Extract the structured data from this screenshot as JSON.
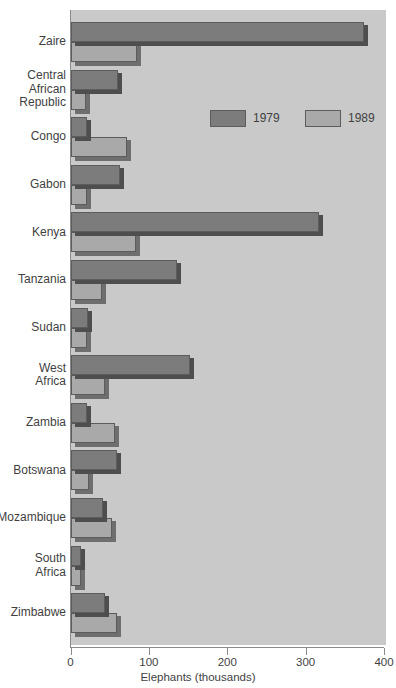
{
  "chart_data": {
    "type": "bar",
    "orientation": "horizontal",
    "title": "",
    "xlabel": "Elephants (thousands)",
    "ylabel": "",
    "xlim": [
      0,
      400
    ],
    "xticks": [
      0,
      100,
      200,
      300,
      400
    ],
    "xtick_labels": [
      "0",
      "100",
      "200",
      "300",
      "400"
    ],
    "grid": false,
    "legend_position": "upper-center",
    "categories": [
      "Zaire",
      "Central\nAfrican\nRepublic",
      "Congo",
      "Gabon",
      "Kenya",
      "Tanzania",
      "Sudan",
      "West\nAfrica",
      "Zambia",
      "Botswana",
      "Mozambique",
      "South\nAfrica",
      "Zimbabwe"
    ],
    "series": [
      {
        "name": "1979",
        "color": "#7c7c7c",
        "values": [
          374,
          61,
          21,
          63,
          317,
          136,
          22,
          153,
          21,
          59,
          42,
          13,
          44
        ]
      },
      {
        "name": "1989",
        "color": "#a9a9a9",
        "values": [
          85,
          20,
          72,
          21,
          83,
          40,
          21,
          44,
          57,
          23,
          53,
          13,
          59
        ]
      }
    ]
  },
  "legend": {
    "items": [
      {
        "label": "1979",
        "swatch": "dark-gray-swatch"
      },
      {
        "label": "1989",
        "swatch": "light-gray-swatch"
      }
    ]
  },
  "axis": {
    "x_title": "Elephants (thousands)",
    "tick_labels": [
      "0",
      "100",
      "200",
      "300",
      "400"
    ]
  }
}
